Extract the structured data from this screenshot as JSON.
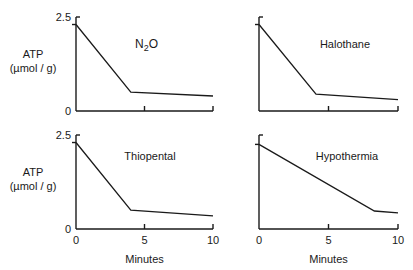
{
  "chart_data": [
    {
      "type": "line",
      "title": "N2O",
      "title_main": "N",
      "title_sub": "2",
      "title_tail": "O",
      "xlabel": "",
      "ylabel": "ATP",
      "ylabel_units": "(µmol / g)",
      "xlim": [
        0,
        10
      ],
      "ylim": [
        0,
        2.5
      ],
      "y_ticks": [
        0,
        2.5
      ],
      "y_tick_labels": [
        "0",
        "2.5"
      ],
      "x_ticks": [
        0,
        5,
        10
      ],
      "x_tick_labels": [],
      "grid": false,
      "x": [
        0,
        4,
        10
      ],
      "y": [
        2.3,
        0.5,
        0.4
      ]
    },
    {
      "type": "line",
      "title": "Halothane",
      "xlabel": "",
      "ylabel": "",
      "xlim": [
        0,
        10
      ],
      "ylim": [
        0,
        2.5
      ],
      "y_ticks": [
        0,
        2.5
      ],
      "y_tick_labels": [],
      "x_ticks": [
        0,
        5,
        10
      ],
      "x_tick_labels": [],
      "grid": false,
      "x": [
        0,
        4.1,
        10
      ],
      "y": [
        2.3,
        0.45,
        0.3
      ]
    },
    {
      "type": "line",
      "title": "Thiopental",
      "xlabel": "Minutes",
      "ylabel": "ATP",
      "ylabel_units": "(µmol / g)",
      "xlim": [
        0,
        10
      ],
      "ylim": [
        0,
        2.5
      ],
      "y_ticks": [
        0,
        2.5
      ],
      "y_tick_labels": [
        "0",
        "2.5"
      ],
      "x_ticks": [
        0,
        5,
        10
      ],
      "x_tick_labels": [
        "0",
        "5",
        "10"
      ],
      "grid": false,
      "x": [
        0,
        4,
        10
      ],
      "y": [
        2.3,
        0.5,
        0.35
      ]
    },
    {
      "type": "line",
      "title": "Hypothermia",
      "xlabel": "Minutes",
      "ylabel": "",
      "xlim": [
        0,
        10
      ],
      "ylim": [
        0,
        2.5
      ],
      "y_ticks": [
        0,
        2.5
      ],
      "y_tick_labels": [],
      "x_ticks": [
        0,
        5,
        10
      ],
      "x_tick_labels": [
        "0",
        "5",
        "10"
      ],
      "grid": false,
      "x": [
        0,
        8.3,
        10
      ],
      "y": [
        2.25,
        0.48,
        0.43
      ]
    }
  ]
}
